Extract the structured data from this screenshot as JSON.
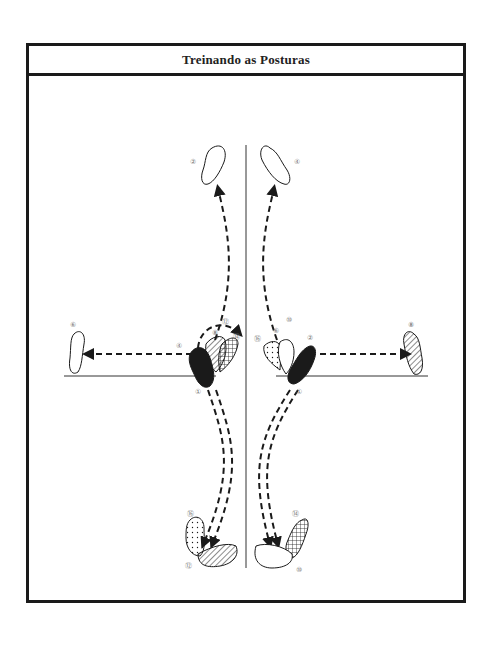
{
  "header": {
    "title": "Treinando as Posturas"
  },
  "diagram": {
    "start_labels": {
      "left_start": "①",
      "right_start": "①"
    },
    "feet": [
      {
        "id": "2",
        "label": "②",
        "side": "left",
        "position": "top-left",
        "fill": "outline"
      },
      {
        "id": "4",
        "label": "④",
        "side": "right",
        "position": "top-right",
        "fill": "outline"
      },
      {
        "id": "6",
        "label": "⑥",
        "side": "left",
        "position": "far-left",
        "fill": "outline"
      },
      {
        "id": "8",
        "label": "⑧",
        "side": "right",
        "position": "far-right",
        "fill": "diagonal-hatch"
      },
      {
        "id": "10",
        "label": "⑩",
        "side": "right",
        "position": "bottom-right",
        "fill": "outline"
      },
      {
        "id": "12",
        "label": "⑫",
        "side": "left",
        "position": "bottom-left",
        "fill": "diagonal-hatch"
      },
      {
        "id": "14",
        "label": "⑭",
        "side": "right",
        "position": "bottom-right",
        "fill": "crosshatch"
      },
      {
        "id": "16",
        "label": "⑯",
        "side": "left",
        "position": "bottom-left",
        "fill": "dotted"
      }
    ],
    "center_left_labels": {
      "four": "④",
      "eight": "⑧",
      "twelve": "⑫",
      "fourteen": "⑭",
      "one": "①"
    },
    "center_right_labels": {
      "sixteen": "⑯",
      "six": "⑥",
      "ten": "⑩",
      "two": "②",
      "one": "①"
    },
    "colors": {
      "ink": "#1a1a1a",
      "label": "#777777",
      "background": "#ffffff"
    }
  }
}
